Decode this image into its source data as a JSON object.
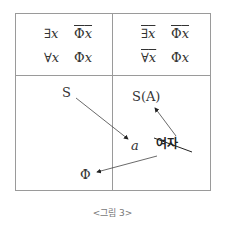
{
  "top_left": {
    "row1": {
      "quantifier": "∃",
      "var": "x",
      "pred": "Φ",
      "pred_var": "x",
      "pred_overline": true
    },
    "row2": {
      "quantifier": "∀",
      "var": "x",
      "pred": "Φ",
      "pred_var": "x"
    }
  },
  "top_right": {
    "row1": {
      "quantifier": "∃",
      "var": "x",
      "pred": "Φ",
      "pred_var": "x",
      "quant_overline": true,
      "pred_overline": true
    },
    "row2": {
      "quantifier": "∀",
      "var": "x",
      "pred": "Φ",
      "pred_var": "x",
      "quant_overline": true
    }
  },
  "bottom": {
    "s_label": "S",
    "sa_label": "S(A)",
    "a_label": "a",
    "phi_label": "Φ",
    "woman_label": "여자"
  },
  "caption": "<그림 3>"
}
